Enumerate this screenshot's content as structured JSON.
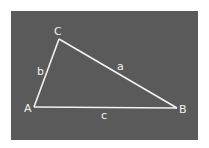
{
  "diagram": {
    "background_color": "#5a5a5a",
    "line_color": "#f2f2f2",
    "vertices": [
      {
        "id": "A",
        "label": "A"
      },
      {
        "id": "B",
        "label": "B"
      },
      {
        "id": "C",
        "label": "C"
      }
    ],
    "sides": [
      {
        "id": "a",
        "label": "a",
        "from": "B",
        "to": "C"
      },
      {
        "id": "b",
        "label": "b",
        "from": "A",
        "to": "C"
      },
      {
        "id": "c",
        "label": "c",
        "from": "A",
        "to": "B"
      }
    ]
  }
}
